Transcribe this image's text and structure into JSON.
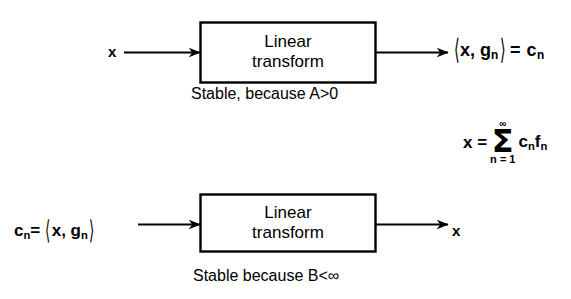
{
  "diagram": {
    "background_color": "#ffffff",
    "stroke_color": "#000000"
  },
  "top_flow": {
    "input_label": "x",
    "block_line1": "Linear",
    "block_line2": "transform",
    "output_label_pre": "",
    "output_inner": "x, g",
    "output_sub1": "n",
    "output_eq": "= c",
    "output_sub2": "n",
    "output_full": "⟨x, gₙ⟩ = cₙ",
    "caption": "Stable, because A>0",
    "arrow_in_name": "arrow-in-top",
    "arrow_out_name": "arrow-out-top"
  },
  "formula": {
    "lead": "x =",
    "sigma": "Σ",
    "upper_limit": "∞",
    "lower_limit": "n = 1",
    "summand": "c",
    "summand_sub1": "n",
    "summand2": "f",
    "summand_sub2": "n",
    "full": "x = Σ(n=1 to ∞) cₙfₙ"
  },
  "bottom_flow": {
    "input_pre": "c",
    "input_sub": "n",
    "input_eq": "=",
    "input_inner": "x, g",
    "input_sub2": "n",
    "input_full": "cₙ= ⟨x, gₙ⟩",
    "block_line1": "Linear",
    "block_line2": "transform",
    "output_label": "x",
    "caption": "Stable because B<∞",
    "arrow_in_name": "arrow-in-bottom",
    "arrow_out_name": "arrow-out-bottom"
  }
}
